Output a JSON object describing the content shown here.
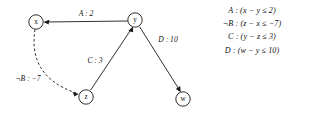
{
  "figure": {
    "type": "constraint-graph",
    "background_color": "#ffffff",
    "ink_color": "#1a1a1a"
  },
  "graph": {
    "nodes": [
      {
        "id": "x",
        "label": "x",
        "cx": 36,
        "cy": 22,
        "r": 7.2
      },
      {
        "id": "y",
        "label": "y",
        "cx": 135,
        "cy": 20,
        "r": 7.2
      },
      {
        "id": "z",
        "label": "z",
        "cx": 86,
        "cy": 97,
        "r": 7.2
      },
      {
        "id": "w",
        "label": "w",
        "cx": 183,
        "cy": 99,
        "r": 7.2
      }
    ],
    "edges": [
      {
        "id": "edge-a",
        "from": "y",
        "to": "x",
        "label": "A : 2",
        "style": "solid",
        "label_x": 86,
        "label_y": 13
      },
      {
        "id": "edge-not-b",
        "from": "x",
        "to": "z",
        "label": "¬B : −7",
        "style": "dashed",
        "label_x": 28,
        "label_y": 78
      },
      {
        "id": "edge-c",
        "from": "z",
        "to": "y",
        "label": "C : 3",
        "style": "solid",
        "label_x": 95,
        "label_y": 60
      },
      {
        "id": "edge-d",
        "from": "y",
        "to": "w",
        "label": "D : 10",
        "style": "solid",
        "label_x": 168,
        "label_y": 39
      }
    ]
  },
  "legend": {
    "entries": [
      {
        "id": "legend-a",
        "text": "A : (x − y ≤ 2)"
      },
      {
        "id": "legend-not-b",
        "text": "¬B : (z − x ≤ −7)"
      },
      {
        "id": "legend-c",
        "text": "C : (y − z ≤ 3)"
      },
      {
        "id": "legend-d",
        "text": "D : (w − y ≤ 10)"
      }
    ]
  }
}
